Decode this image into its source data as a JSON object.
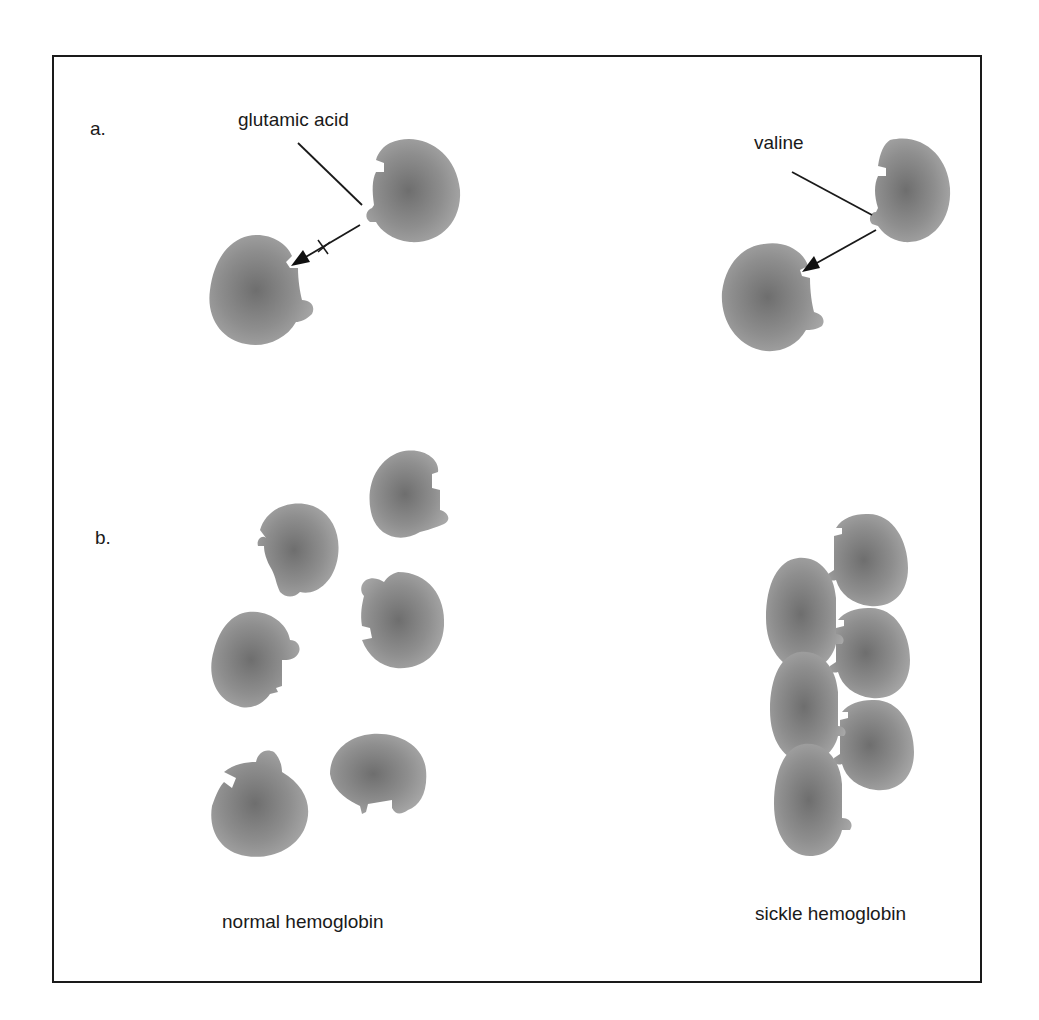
{
  "figure": {
    "panel_a": {
      "letter": "a.",
      "left_label": "glutamic acid",
      "right_label": "valine",
      "left_arrow_mark": "blocked (x)",
      "right_arrow_mark": "binds"
    },
    "panel_b": {
      "letter": "b.",
      "left_caption": "normal hemoglobin",
      "right_caption": "sickle hemoglobin"
    },
    "colors": {
      "frame": "#1a1a1a",
      "molecule_center": "#6e6e6e",
      "molecule_edge": "#a4a4a4",
      "text": "#1a1a1a"
    }
  }
}
